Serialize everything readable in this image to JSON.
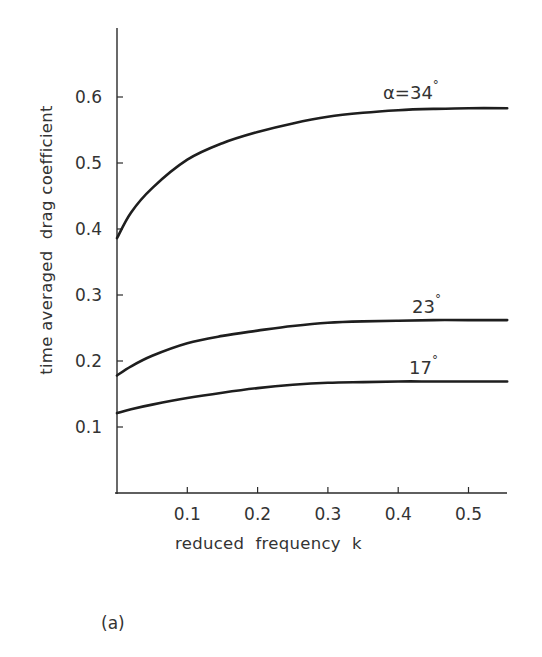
{
  "chart_data": {
    "type": "line",
    "title": "",
    "panel_label": "(a)",
    "xlabel": "reduced  frequency  k",
    "ylabel": "time averaged  drag coefficient",
    "xlim": [
      0,
      0.555
    ],
    "ylim": [
      0,
      0.7
    ],
    "grid": false,
    "legend": "inline curve annotations",
    "x_ticks": [
      "0.1",
      "0.2",
      "0.3",
      "0.4",
      "0.5"
    ],
    "y_ticks": [
      "0.1",
      "0.2",
      "0.3",
      "0.4",
      "0.5",
      "0.6"
    ],
    "x": [
      0.0,
      0.02,
      0.05,
      0.1,
      0.15,
      0.2,
      0.25,
      0.3,
      0.35,
      0.4,
      0.45,
      0.5,
      0.555
    ],
    "series": [
      {
        "name": "α=34°",
        "label": "α=34",
        "values": [
          0.386,
          0.425,
          0.462,
          0.505,
          0.53,
          0.547,
          0.56,
          0.57,
          0.576,
          0.58,
          0.582,
          0.583,
          0.583
        ]
      },
      {
        "name": "23°",
        "label": "23",
        "values": [
          0.178,
          0.192,
          0.208,
          0.227,
          0.238,
          0.246,
          0.253,
          0.258,
          0.26,
          0.261,
          0.262,
          0.262,
          0.262
        ]
      },
      {
        "name": "17°",
        "label": "17",
        "values": [
          0.121,
          0.127,
          0.134,
          0.144,
          0.152,
          0.159,
          0.164,
          0.167,
          0.168,
          0.169,
          0.169,
          0.169,
          0.169
        ]
      }
    ],
    "degree_symbol": "°"
  }
}
